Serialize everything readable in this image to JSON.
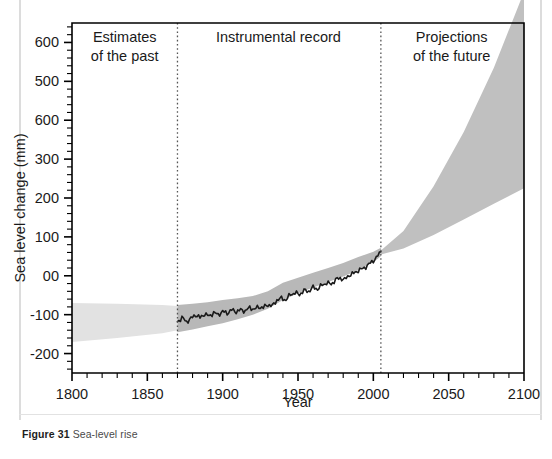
{
  "figure": {
    "caption_label": "Figure 31",
    "caption_text": "Sea-level rise"
  },
  "chart_data": {
    "type": "area",
    "title": "Sea-level rise",
    "xlabel": "Year",
    "ylabel": "Sea level change (mm)",
    "xlim": [
      1800,
      2100
    ],
    "ylim": [
      -250,
      650
    ],
    "xticks": [
      1800,
      1850,
      1900,
      1950,
      2000,
      2050,
      2100
    ],
    "xtick_labels": [
      "1800",
      "1850",
      "1900",
      "1950",
      "2000",
      "2050",
      "2100"
    ],
    "x_minor_tick_step": 10,
    "yticks": [
      -200,
      -100,
      0,
      100,
      200,
      300,
      400,
      500,
      600
    ],
    "ytick_labels": [
      "-200",
      "-100",
      "00",
      "100",
      "200",
      "300",
      "600",
      "500",
      "600"
    ],
    "y_minor_tick_step": 20,
    "grid": false,
    "legend": "none",
    "panels": [
      {
        "name": "estimates-of-the-past",
        "label": "Estimates\nof the past",
        "x_start": 1800,
        "x_end": 1870,
        "label_x": 1835,
        "label_y": 600
      },
      {
        "name": "instrumental-record",
        "label": "Instrumental record",
        "x_start": 1870,
        "x_end": 2005,
        "label_x": 1937,
        "label_y": 600
      },
      {
        "name": "projections-of-the-future",
        "label": "Projections\nof the future",
        "x_start": 2005,
        "x_end": 2100,
        "label_x": 2052,
        "label_y": 600
      }
    ],
    "dividers": [
      1870,
      2005
    ],
    "colors": {
      "past_band": "#e2e2e2",
      "instrumental_band": "#b8b8b8",
      "projection_band": "#c0c0c0",
      "observed_line": "#1a1a1a",
      "axis": "#000000",
      "divider": "#555555"
    },
    "series": [
      {
        "name": "Estimates of the past (uncertainty band)",
        "type": "band",
        "x": [
          1800,
          1830,
          1860,
          1870
        ],
        "upper": [
          -70,
          -72,
          -75,
          -78
        ],
        "lower": [
          -170,
          -160,
          -148,
          -140
        ]
      },
      {
        "name": "Instrumental record (uncertainty band)",
        "type": "band",
        "x": [
          1870,
          1880,
          1890,
          1900,
          1910,
          1920,
          1930,
          1940,
          1950,
          1960,
          1970,
          1980,
          1990,
          2000,
          2005
        ],
        "upper": [
          -75,
          -72,
          -68,
          -62,
          -58,
          -52,
          -40,
          -18,
          -5,
          8,
          20,
          33,
          48,
          62,
          72
        ],
        "lower": [
          -145,
          -138,
          -130,
          -122,
          -112,
          -100,
          -85,
          -62,
          -45,
          -30,
          -16,
          -2,
          14,
          35,
          50
        ]
      },
      {
        "name": "Observed sea level (instrumental record)",
        "type": "line",
        "x": [
          1870,
          1873,
          1876,
          1879,
          1882,
          1885,
          1888,
          1891,
          1894,
          1897,
          1900,
          1903,
          1906,
          1909,
          1912,
          1915,
          1918,
          1921,
          1924,
          1927,
          1930,
          1933,
          1936,
          1939,
          1942,
          1945,
          1948,
          1951,
          1954,
          1957,
          1960,
          1963,
          1966,
          1969,
          1972,
          1975,
          1978,
          1981,
          1984,
          1987,
          1990,
          1993,
          1996,
          1999,
          2002,
          2005
        ],
        "y": [
          -118,
          -108,
          -118,
          -110,
          -100,
          -108,
          -98,
          -104,
          -95,
          -100,
          -92,
          -96,
          -88,
          -92,
          -88,
          -90,
          -82,
          -86,
          -80,
          -82,
          -74,
          -78,
          -62,
          -58,
          -62,
          -48,
          -44,
          -48,
          -38,
          -40,
          -30,
          -34,
          -24,
          -18,
          -22,
          -10,
          -6,
          -10,
          2,
          6,
          14,
          18,
          26,
          36,
          46,
          62
        ]
      },
      {
        "name": "Projections of the future (uncertainty fan)",
        "type": "band",
        "x": [
          2005,
          2020,
          2040,
          2060,
          2080,
          2100
        ],
        "upper": [
          65,
          115,
          230,
          370,
          535,
          730
        ],
        "lower": [
          55,
          70,
          105,
          145,
          185,
          225
        ]
      }
    ]
  }
}
